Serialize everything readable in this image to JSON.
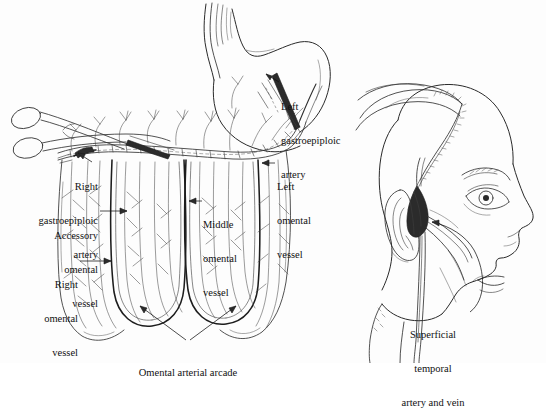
{
  "figure": {
    "background_color": "#fdfdfd",
    "ink_color": "#2a2a2a",
    "style": "black-and-white pen-and-ink medical illustration"
  },
  "panels": {
    "left": {
      "name": "omentum-stomach-panel",
      "subject": "stomach with greater omentum and gastroepiploic arcade, surgical clamp applied"
    },
    "right": {
      "name": "head-panel",
      "subject": "lateral view of head with scalp flap elevated exposing superficial temporal vessels"
    }
  },
  "labels": [
    {
      "id": "left-gastroepiploic-artery",
      "lines": [
        "Left",
        "gastroepiploic",
        "artery"
      ],
      "align": "left",
      "x": 281,
      "y": 78
    },
    {
      "id": "right-gastroepiploic-artery",
      "lines": [
        "Right",
        "gastroepiploic",
        "artery"
      ],
      "align": "right",
      "x": 6,
      "y": 158
    },
    {
      "id": "left-omental-vessel",
      "lines": [
        "Left",
        "omental",
        "vessel"
      ],
      "align": "left",
      "x": 277,
      "y": 158
    },
    {
      "id": "middle-omental-vessel",
      "lines": [
        "Middle",
        "omental",
        "vessel"
      ],
      "align": "left",
      "x": 203,
      "y": 196
    },
    {
      "id": "accessory-omental-vessel",
      "lines": [
        "Accessory",
        "omental",
        "vessel"
      ],
      "align": "right",
      "x": 14,
      "y": 207
    },
    {
      "id": "right-omental-vessel",
      "lines": [
        "Right",
        "omental",
        "vessel"
      ],
      "align": "right",
      "x": 14,
      "y": 256
    },
    {
      "id": "omental-arterial-arcade",
      "lines": [
        "Omental arterial arcade"
      ],
      "align": "center",
      "x": 124,
      "y": 344
    },
    {
      "id": "superficial-temporal-artery-and-vein",
      "lines": [
        "Superficial",
        "temporal",
        "artery and vein"
      ],
      "align": "center",
      "x": 378,
      "y": 306
    }
  ]
}
